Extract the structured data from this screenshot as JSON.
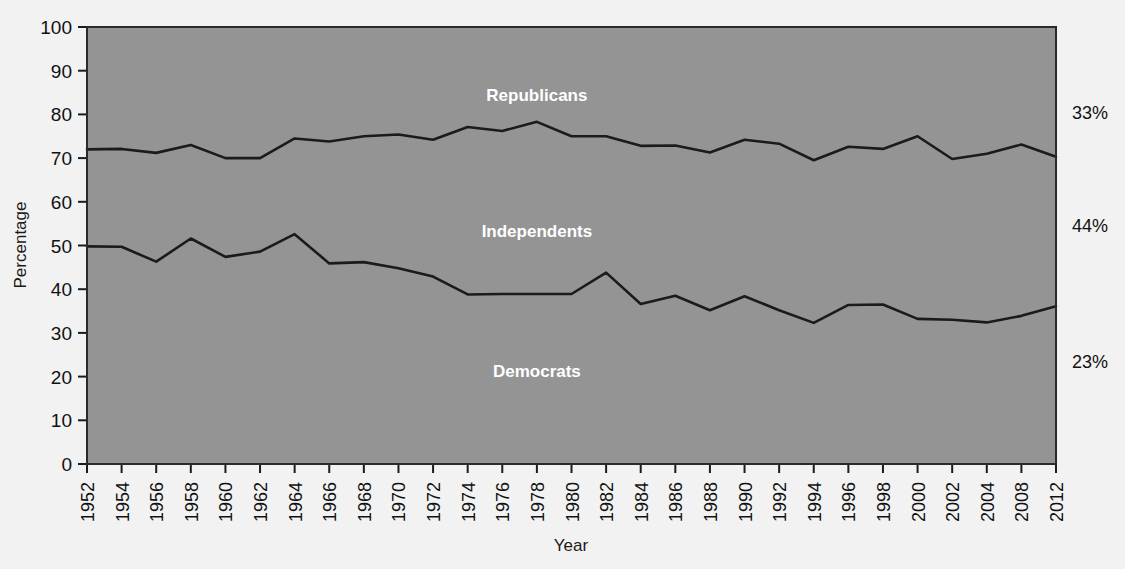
{
  "chart_data": {
    "type": "area",
    "title": "",
    "xlabel": "Year",
    "ylabel": "Percentage",
    "ylim": [
      0,
      100
    ],
    "grid": false,
    "legend_position": "inline-band-labels",
    "stacked": true,
    "categories": [
      1952,
      1954,
      1956,
      1958,
      1960,
      1962,
      1964,
      1966,
      1968,
      1970,
      1972,
      1974,
      1976,
      1978,
      1980,
      1982,
      1984,
      1986,
      1988,
      1990,
      1992,
      1994,
      1996,
      1998,
      2000,
      2002,
      2004,
      2008,
      2012
    ],
    "tick_labels_x": [
      "1952",
      "1954",
      "1956",
      "1958",
      "1960",
      "1962",
      "1964",
      "1966",
      "1968",
      "1970",
      "1972",
      "1974",
      "1976",
      "1978",
      "1980",
      "1982",
      "1984",
      "1986",
      "1988",
      "1990",
      "1992",
      "1994",
      "1996",
      "1998",
      "2000",
      "2002",
      "2004",
      "2008",
      "2012"
    ],
    "tick_labels_y": [
      "0",
      "10",
      "20",
      "30",
      "40",
      "50",
      "60",
      "70",
      "80",
      "90",
      "100"
    ],
    "tick_values_y": [
      0,
      10,
      20,
      30,
      40,
      50,
      60,
      70,
      80,
      90,
      100
    ],
    "series": [
      {
        "name": "Democrats",
        "description": "Lower cumulative boundary line: percentage identifying as Democrats",
        "values": [
          49.8,
          49.7,
          46.3,
          51.6,
          47.4,
          48.6,
          52.6,
          45.9,
          46.2,
          44.8,
          42.9,
          38.8,
          38.9,
          38.9,
          38.9,
          43.8,
          36.6,
          38.5,
          35.2,
          38.4,
          35.2,
          32.3,
          36.4,
          36.5,
          33.2,
          33.0,
          32.4,
          33.9,
          36.1
        ]
      },
      {
        "name": "Independents",
        "description": "Middle band between lower and upper boundary lines",
        "values": [
          22.2,
          22.4,
          24.9,
          21.4,
          22.6,
          21.4,
          21.9,
          27.9,
          28.8,
          30.6,
          31.3,
          38.3,
          37.3,
          39.4,
          36.1,
          31.2,
          36.2,
          34.4,
          36.1,
          35.8,
          38.1,
          37.2,
          36.2,
          35.6,
          41.9,
          36.8,
          38.6,
          39.2,
          34.2
        ]
      },
      {
        "name": "Republicans",
        "description": "Upper band above the upper boundary line, to 100%",
        "values": [
          28.0,
          27.9,
          28.8,
          27.0,
          30.0,
          30.0,
          25.5,
          26.2,
          25.0,
          24.6,
          25.8,
          22.9,
          23.8,
          21.7,
          25.0,
          25.0,
          27.2,
          27.1,
          28.7,
          25.8,
          26.7,
          30.5,
          27.4,
          27.9,
          25.0,
          30.2,
          29.0,
          26.9,
          29.7
        ]
      }
    ],
    "boundary_lines": {
      "democrats_upper_edge": [
        49.8,
        49.7,
        46.3,
        51.6,
        47.4,
        48.6,
        52.6,
        45.9,
        46.2,
        44.8,
        42.9,
        38.8,
        38.9,
        38.9,
        38.9,
        43.8,
        36.6,
        38.5,
        35.2,
        38.4,
        35.2,
        32.3,
        36.4,
        36.5,
        33.2,
        33.0,
        32.4,
        33.9,
        36.1
      ],
      "independents_upper_edge": [
        72.0,
        72.1,
        71.2,
        73.0,
        70.0,
        70.0,
        74.5,
        73.8,
        75.0,
        75.4,
        74.2,
        77.1,
        76.2,
        78.3,
        75.0,
        75.0,
        72.8,
        72.9,
        71.3,
        74.2,
        73.3,
        69.5,
        72.6,
        72.1,
        75.0,
        69.8,
        71.0,
        73.1,
        70.3
      ]
    },
    "band_labels": [
      {
        "text": "Republicans",
        "x_year": 1978,
        "y_pct": 83
      },
      {
        "text": "Independents",
        "x_year": 1978,
        "y_pct": 52
      },
      {
        "text": "Democrats",
        "x_year": 1978,
        "y_pct": 20
      }
    ],
    "right_annotations": [
      {
        "text": "33%",
        "series": "Republicans",
        "y_pct": 79
      },
      {
        "text": "44%",
        "series": "Independents",
        "y_pct": 53
      },
      {
        "text": "23%",
        "series": "Democrats",
        "y_pct": 22
      }
    ],
    "colors": {
      "plot_background": "#949494",
      "line": "#1b1b1b",
      "band_label_text": "#ffffff",
      "axis_text": "#111111",
      "page_background": "#f2f2f2"
    }
  }
}
